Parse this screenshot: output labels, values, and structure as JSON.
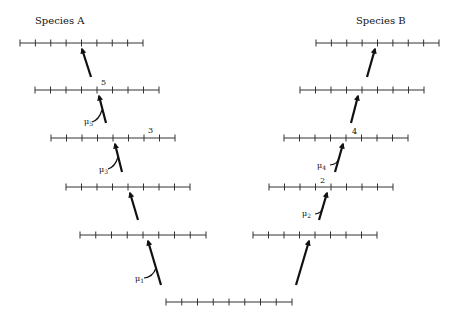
{
  "diagram": {
    "type": "phylogenetic-mutation-ladder",
    "species": [
      {
        "id": "A",
        "label": "Species A"
      },
      {
        "id": "B",
        "label": "Species B"
      }
    ],
    "bars": [
      {
        "id": "base",
        "y": 302,
        "x1": 166,
        "x2": 292
      },
      {
        "id": "A5",
        "y": 235,
        "x1": 80,
        "x2": 206
      },
      {
        "id": "A4",
        "y": 187,
        "x1": 66,
        "x2": 190
      },
      {
        "id": "A3",
        "y": 138,
        "x1": 51,
        "x2": 175
      },
      {
        "id": "A2",
        "y": 90,
        "x1": 35,
        "x2": 159
      },
      {
        "id": "A1",
        "y": 43,
        "x1": 20,
        "x2": 143
      },
      {
        "id": "B5",
        "y": 235,
        "x1": 253,
        "x2": 377
      },
      {
        "id": "B4",
        "y": 187,
        "x1": 269,
        "x2": 393
      },
      {
        "id": "B3",
        "y": 138,
        "x1": 284,
        "x2": 408
      },
      {
        "id": "B2",
        "y": 90,
        "x1": 300,
        "x2": 424
      },
      {
        "id": "B1",
        "y": 43,
        "x1": 316,
        "x2": 439
      }
    ],
    "ticks_per_bar": 9,
    "site_labels": [
      {
        "text": "5",
        "x": 101,
        "y": 85
      },
      {
        "text": "3",
        "x": 149,
        "y": 133
      },
      {
        "text": "4",
        "x": 352,
        "y": 134
      },
      {
        "text": "2",
        "x": 321,
        "y": 183
      }
    ],
    "mutation_labels": [
      {
        "text": "μ5",
        "main": "μ",
        "sub": "5",
        "x": 85,
        "y": 124
      },
      {
        "text": "μ3",
        "main": "μ",
        "sub": "3",
        "x": 100,
        "y": 172
      },
      {
        "text": "μ4",
        "main": "μ",
        "sub": "4",
        "x": 317,
        "y": 168
      },
      {
        "text": "μ2",
        "main": "μ",
        "sub": "2",
        "x": 302,
        "y": 216
      },
      {
        "text": "μ1",
        "main": "μ",
        "sub": "1",
        "x": 137,
        "y": 280
      }
    ]
  }
}
